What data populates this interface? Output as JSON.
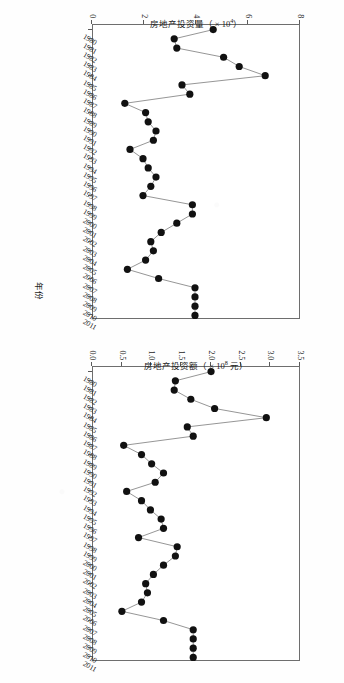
{
  "figure": {
    "background_color": "#fefefe",
    "line_color": "#8a8a8a",
    "marker_color": "#111111",
    "axis_color": "#6e6e6e",
    "x_axis_title": "年份"
  },
  "chart_data": [
    {
      "type": "line",
      "title": "",
      "xlabel": "年份",
      "ylabel": "房地产投资量（× 10⁴）",
      "ylabel_text": "房地产投资量（ × 10",
      "ylabel_exp": "4",
      "ylabel_tail": "）",
      "xlim": [
        1980,
        2011
      ],
      "ylim": [
        0,
        8
      ],
      "yticks": [
        "0",
        "2",
        "4",
        "6",
        "8"
      ],
      "ytick_values": [
        0,
        2,
        4,
        6,
        8
      ],
      "grid": false,
      "legend": "none",
      "categories": [
        1980,
        1981,
        1982,
        1983,
        1984,
        1985,
        1986,
        1987,
        1988,
        1989,
        1990,
        1991,
        1992,
        1993,
        1994,
        1995,
        1996,
        1997,
        1998,
        1999,
        2000,
        2001,
        2002,
        2003,
        2004,
        2005,
        2006,
        2007,
        2008,
        2009,
        2010,
        2011
      ],
      "xtick_labels": [
        "1980",
        "1981",
        "1982",
        "1983",
        "1984",
        "1985",
        "1986",
        "1987",
        "1988",
        "1989",
        "1990",
        "1991",
        "1992",
        "1993",
        "1994",
        "1995",
        "1996",
        "1997",
        "1998",
        "1999",
        "2000",
        "2001",
        "2002",
        "2003",
        "2004",
        "2005",
        "2006",
        "2007",
        "2008",
        "2009",
        "2010",
        "2011"
      ],
      "values": [
        4.7,
        3.2,
        3.3,
        5.1,
        5.7,
        6.7,
        3.5,
        3.8,
        1.3,
        2.1,
        2.2,
        2.5,
        2.4,
        1.5,
        2.0,
        2.2,
        2.5,
        2.3,
        2.0,
        3.9,
        3.9,
        3.3,
        2.7,
        2.3,
        2.4,
        2.1,
        1.4,
        2.6,
        4.0,
        4.0,
        4.0,
        4.0
      ]
    },
    {
      "type": "line",
      "title": "",
      "xlabel": "年份",
      "ylabel": "房地产投资额（× 10⁸ 元）",
      "ylabel_text": "房地产投资额（ × 10",
      "ylabel_exp": "8",
      "ylabel_tail": " 元）",
      "xlim": [
        1980,
        2011
      ],
      "ylim": [
        0.0,
        3.5
      ],
      "yticks": [
        "0.0",
        "0.5",
        "1.0",
        "1.5",
        "2.0",
        "2.5",
        "3.0",
        "3.5"
      ],
      "ytick_values": [
        0.0,
        0.5,
        1.0,
        1.5,
        2.0,
        2.5,
        3.0,
        3.5
      ],
      "grid": false,
      "legend": "none",
      "categories": [
        1980,
        1981,
        1982,
        1983,
        1984,
        1985,
        1986,
        1987,
        1988,
        1989,
        1990,
        1991,
        1992,
        1993,
        1994,
        1995,
        1996,
        1997,
        1998,
        1999,
        2000,
        2001,
        2002,
        2003,
        2004,
        2005,
        2006,
        2007,
        2008,
        2009,
        2010,
        2011
      ],
      "xtick_labels": [
        "1980",
        "1981",
        "1982",
        "1983",
        "1984",
        "1985",
        "1986",
        "1987",
        "1988",
        "1989",
        "1990",
        "1991",
        "1992",
        "1993",
        "1994",
        "1995",
        "1996",
        "1997",
        "1998",
        "1999",
        "2000",
        "2001",
        "2002",
        "2003",
        "2004",
        "2005",
        "2006",
        "2007",
        "2008",
        "2009",
        "2010",
        "2011"
      ],
      "values": [
        2.02,
        1.42,
        1.4,
        1.68,
        2.08,
        2.95,
        1.62,
        1.72,
        0.55,
        0.85,
        1.02,
        1.22,
        1.08,
        0.6,
        0.85,
        1.0,
        1.18,
        1.22,
        0.8,
        1.45,
        1.42,
        1.22,
        1.05,
        0.92,
        0.95,
        0.85,
        0.52,
        1.22,
        1.72,
        1.72,
        1.72,
        1.72
      ]
    }
  ]
}
